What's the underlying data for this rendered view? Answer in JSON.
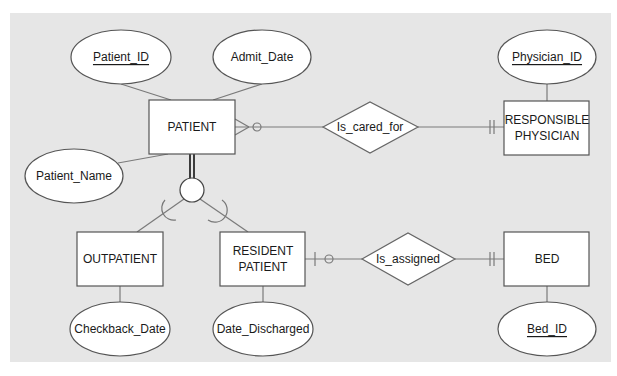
{
  "diagram": {
    "type": "Enhanced ER diagram (crow's foot notation with supertype/subtype)",
    "colors": {
      "panel": "#e6e6e6",
      "entity_fill": "#ffffff",
      "stroke": "#555555",
      "line": "#7a7a7a"
    },
    "entities": {
      "patient": {
        "label": "PATIENT"
      },
      "responsible_physician": {
        "line1": "RESPONSIBLE",
        "line2": "PHYSICIAN"
      },
      "outpatient": {
        "label": "OUTPATIENT"
      },
      "resident_patient": {
        "line1": "RESIDENT",
        "line2": "PATIENT"
      },
      "bed": {
        "label": "BED"
      }
    },
    "attributes": {
      "patient_id": {
        "label": "Patient_ID",
        "key": true
      },
      "admit_date": {
        "label": "Admit_Date",
        "key": false
      },
      "patient_name": {
        "label": "Patient_Name",
        "key": false
      },
      "physician_id": {
        "label": "Physician_ID",
        "key": true
      },
      "checkback_date": {
        "label": "Checkback_Date",
        "key": false
      },
      "date_discharged": {
        "label": "Date_Discharged",
        "key": false
      },
      "bed_id": {
        "label": "Bed_ID",
        "key": true
      }
    },
    "relationships": {
      "is_cared_for": {
        "label": "Is_cared_for",
        "from": "PATIENT",
        "from_cardinality": "zero-or-many",
        "to": "RESPONSIBLE PHYSICIAN",
        "to_cardinality": "one-and-only-one"
      },
      "is_assigned": {
        "label": "Is_assigned",
        "from": "RESIDENT PATIENT",
        "from_cardinality": "zero-or-one",
        "to": "BED",
        "to_cardinality": "one-and-only-one"
      }
    },
    "specialization": {
      "supertype": "PATIENT",
      "subtypes": [
        "OUTPATIENT",
        "RESIDENT PATIENT"
      ],
      "completeness": "total (double line)"
    }
  }
}
